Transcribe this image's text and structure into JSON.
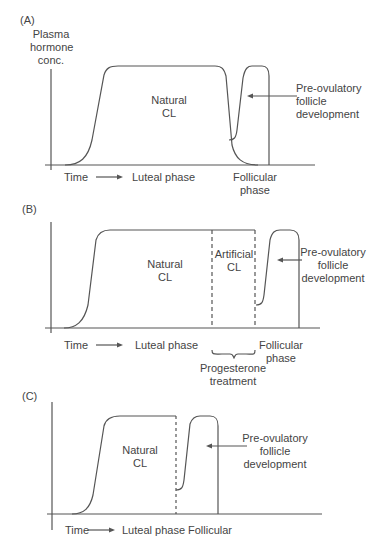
{
  "panels": [
    {
      "id": "A",
      "label": "(A)",
      "y_axis_label_lines": [
        "Plasma",
        "hormone",
        "conc."
      ],
      "curve_label_lines": [
        "Natural",
        "CL"
      ],
      "follicle_label_lines": [
        "Pre-ovulatory",
        "follicle",
        "development"
      ],
      "x_axis": {
        "time": "Time",
        "luteal": "Luteal phase",
        "follicular_lines": [
          "Follicular",
          "phase"
        ]
      }
    },
    {
      "id": "B",
      "label": "(B)",
      "curve_label_lines": [
        "Natural",
        "CL"
      ],
      "artificial_label_lines": [
        "Artificial",
        "CL"
      ],
      "follicle_label_lines": [
        "Pre-ovulatory",
        "follicle",
        "development"
      ],
      "x_axis": {
        "time": "Time",
        "luteal": "Luteal phase",
        "follicular_lines": [
          "Follicular",
          "phase"
        ]
      },
      "treatment_label_lines": [
        "Progesterone",
        "treatment"
      ]
    },
    {
      "id": "C",
      "label": "(C)",
      "curve_label_lines": [
        "Natural",
        "CL"
      ],
      "follicle_label_lines": [
        "Pre-ovulatory",
        "follicle",
        "development"
      ],
      "x_axis": {
        "time": "Time",
        "luteal": "Luteal phase",
        "follicular": "Follicular"
      }
    }
  ],
  "colors": {
    "line": "#555555",
    "text": "#444444"
  }
}
